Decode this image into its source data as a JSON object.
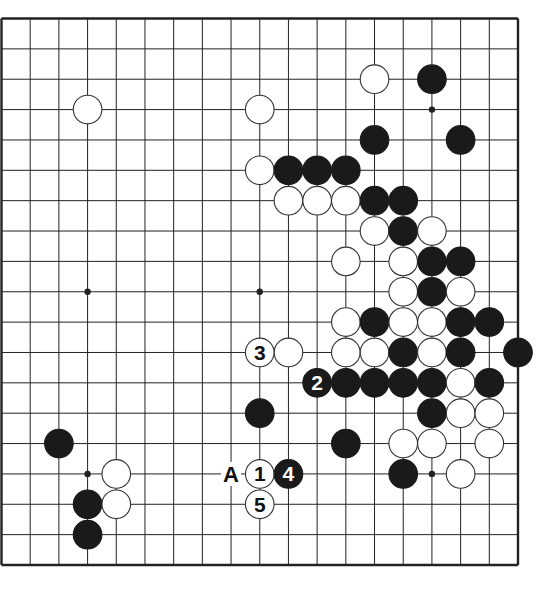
{
  "diagram": {
    "type": "go-board",
    "board_size": 19,
    "colors": {
      "line": "#222222",
      "black": "#1a1a1a",
      "white": "#ffffff",
      "background": "#ffffff"
    },
    "star_points": [
      [
        3,
        3
      ],
      [
        9,
        3
      ],
      [
        15,
        3
      ],
      [
        3,
        9
      ],
      [
        9,
        9
      ],
      [
        15,
        9
      ],
      [
        3,
        15
      ],
      [
        9,
        15
      ],
      [
        15,
        15
      ]
    ],
    "stones": [
      {
        "c": 13,
        "r": 2,
        "color": "white"
      },
      {
        "c": 15,
        "r": 2,
        "color": "black"
      },
      {
        "c": 3,
        "r": 3,
        "color": "white"
      },
      {
        "c": 9,
        "r": 3,
        "color": "white"
      },
      {
        "c": 13,
        "r": 4,
        "color": "black"
      },
      {
        "c": 16,
        "r": 4,
        "color": "black"
      },
      {
        "c": 9,
        "r": 5,
        "color": "white"
      },
      {
        "c": 10,
        "r": 5,
        "color": "black"
      },
      {
        "c": 11,
        "r": 5,
        "color": "black"
      },
      {
        "c": 12,
        "r": 5,
        "color": "black"
      },
      {
        "c": 10,
        "r": 6,
        "color": "white"
      },
      {
        "c": 11,
        "r": 6,
        "color": "white"
      },
      {
        "c": 12,
        "r": 6,
        "color": "white"
      },
      {
        "c": 13,
        "r": 6,
        "color": "black"
      },
      {
        "c": 14,
        "r": 6,
        "color": "black"
      },
      {
        "c": 13,
        "r": 7,
        "color": "white"
      },
      {
        "c": 14,
        "r": 7,
        "color": "black"
      },
      {
        "c": 15,
        "r": 7,
        "color": "white"
      },
      {
        "c": 12,
        "r": 8,
        "color": "white"
      },
      {
        "c": 14,
        "r": 8,
        "color": "white"
      },
      {
        "c": 15,
        "r": 8,
        "color": "black"
      },
      {
        "c": 16,
        "r": 8,
        "color": "black"
      },
      {
        "c": 14,
        "r": 9,
        "color": "white"
      },
      {
        "c": 15,
        "r": 9,
        "color": "black"
      },
      {
        "c": 16,
        "r": 9,
        "color": "white"
      },
      {
        "c": 12,
        "r": 10,
        "color": "white"
      },
      {
        "c": 13,
        "r": 10,
        "color": "black"
      },
      {
        "c": 14,
        "r": 10,
        "color": "white"
      },
      {
        "c": 15,
        "r": 10,
        "color": "white"
      },
      {
        "c": 16,
        "r": 10,
        "color": "black"
      },
      {
        "c": 17,
        "r": 10,
        "color": "black"
      },
      {
        "c": 10,
        "r": 11,
        "color": "white"
      },
      {
        "c": 12,
        "r": 11,
        "color": "white"
      },
      {
        "c": 13,
        "r": 11,
        "color": "white"
      },
      {
        "c": 14,
        "r": 11,
        "color": "black"
      },
      {
        "c": 15,
        "r": 11,
        "color": "white"
      },
      {
        "c": 16,
        "r": 11,
        "color": "black"
      },
      {
        "c": 18,
        "r": 11,
        "color": "black"
      },
      {
        "c": 12,
        "r": 12,
        "color": "black"
      },
      {
        "c": 13,
        "r": 12,
        "color": "black"
      },
      {
        "c": 14,
        "r": 12,
        "color": "black"
      },
      {
        "c": 15,
        "r": 12,
        "color": "black"
      },
      {
        "c": 16,
        "r": 12,
        "color": "white"
      },
      {
        "c": 17,
        "r": 12,
        "color": "black"
      },
      {
        "c": 9,
        "r": 13,
        "color": "black"
      },
      {
        "c": 15,
        "r": 13,
        "color": "black"
      },
      {
        "c": 16,
        "r": 13,
        "color": "white"
      },
      {
        "c": 17,
        "r": 13,
        "color": "white"
      },
      {
        "c": 2,
        "r": 14,
        "color": "black"
      },
      {
        "c": 12,
        "r": 14,
        "color": "black"
      },
      {
        "c": 14,
        "r": 14,
        "color": "white"
      },
      {
        "c": 15,
        "r": 14,
        "color": "white"
      },
      {
        "c": 17,
        "r": 14,
        "color": "white"
      },
      {
        "c": 4,
        "r": 15,
        "color": "white"
      },
      {
        "c": 14,
        "r": 15,
        "color": "black"
      },
      {
        "c": 16,
        "r": 15,
        "color": "white"
      },
      {
        "c": 3,
        "r": 16,
        "color": "black"
      },
      {
        "c": 4,
        "r": 16,
        "color": "white"
      },
      {
        "c": 3,
        "r": 17,
        "color": "black"
      }
    ],
    "numbered_moves": [
      {
        "c": 9,
        "r": 15,
        "color": "white",
        "label": "1"
      },
      {
        "c": 11,
        "r": 12,
        "color": "black",
        "label": "2"
      },
      {
        "c": 9,
        "r": 11,
        "color": "white",
        "label": "3"
      },
      {
        "c": 10,
        "r": 15,
        "color": "black",
        "label": "4"
      },
      {
        "c": 9,
        "r": 16,
        "color": "white",
        "label": "5"
      }
    ],
    "letter_marks": [
      {
        "c": 8,
        "r": 15,
        "label": "A"
      }
    ]
  }
}
